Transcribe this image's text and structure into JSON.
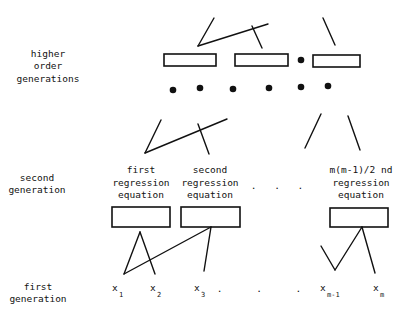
{
  "diagram": {
    "type": "hierarchical-regression-network",
    "row_labels": {
      "higher": [
        "higher",
        "order",
        "generations"
      ],
      "second": [
        "second",
        "generation"
      ],
      "first": [
        "first",
        "generation"
      ]
    },
    "second_generation_nodes": [
      {
        "lines": [
          "first",
          "regression",
          "equation"
        ]
      },
      {
        "lines": [
          "second",
          "regression",
          "equation"
        ]
      },
      {
        "lines": [
          "m(m-1)/2 nd",
          "regression",
          "equation"
        ]
      }
    ],
    "ellipsis": ". . .",
    "first_generation_inputs": [
      {
        "base": "x",
        "sub": "1"
      },
      {
        "base": "x",
        "sub": "2"
      },
      {
        "base": "x",
        "sub": "3"
      },
      {
        "base": "x",
        "sub": "m-1"
      },
      {
        "base": "x",
        "sub": "m"
      }
    ],
    "colors": {
      "ink": "#111111",
      "background": "#ffffff"
    }
  }
}
